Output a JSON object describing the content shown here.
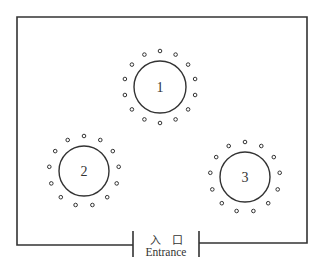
{
  "diagram": {
    "type": "floor-plan",
    "stroke_color": "#333333",
    "room": {
      "left": 17,
      "top": 17,
      "right": 307,
      "bottom_left": 245,
      "bottom_right": 243
    },
    "tables": [
      {
        "label": "1",
        "cx": 160,
        "cy": 87,
        "r": 26,
        "seats": 14,
        "seat_ring_r": 36
      },
      {
        "label": "2",
        "cx": 84,
        "cy": 171,
        "r": 25,
        "seats": 13,
        "seat_ring_r": 35
      },
      {
        "label": "3",
        "cx": 245,
        "cy": 177,
        "r": 25,
        "seats": 13,
        "seat_ring_r": 35
      }
    ],
    "entrance": {
      "label_cn": "入　口",
      "label_en": "Entrance",
      "left_post_x": 133,
      "right_post_x": 199,
      "post_top": 231,
      "post_bottom": 257
    }
  }
}
